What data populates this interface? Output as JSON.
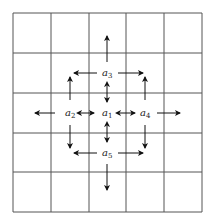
{
  "diagram": {
    "type": "grid-neighborhood",
    "grid": {
      "rows": 5,
      "cols": 5,
      "x0": 13,
      "y0": 13,
      "x1": 202,
      "y1": 212,
      "xlines": [
        13,
        51,
        89,
        126,
        164,
        202
      ],
      "ylines": [
        13,
        53,
        93,
        133,
        172,
        212
      ],
      "line_color": "#555555"
    },
    "labels": [
      {
        "id": "a1",
        "base": "a",
        "sub": "1",
        "x": 102,
        "y": 116
      },
      {
        "id": "a2",
        "base": "a",
        "sub": "2",
        "x": 65,
        "y": 116
      },
      {
        "id": "a3",
        "base": "a",
        "sub": "3",
        "x": 102,
        "y": 76
      },
      {
        "id": "a4",
        "base": "a",
        "sub": "4",
        "x": 140,
        "y": 116
      },
      {
        "id": "a5",
        "base": "a",
        "sub": "5",
        "x": 102,
        "y": 156
      }
    ],
    "arrows": [
      {
        "from": [
          107,
          62
        ],
        "to": [
          107,
          36
        ],
        "double": false
      },
      {
        "from": [
          97,
          73
        ],
        "to": [
          74,
          73
        ],
        "double": false
      },
      {
        "from": [
          118,
          73
        ],
        "to": [
          143,
          73
        ],
        "double": false
      },
      {
        "from": [
          70,
          100
        ],
        "to": [
          70,
          77
        ],
        "double": false
      },
      {
        "from": [
          145,
          100
        ],
        "to": [
          145,
          77
        ],
        "double": false
      },
      {
        "from": [
          107,
          86
        ],
        "to": [
          107,
          102
        ],
        "double": true
      },
      {
        "from": [
          55,
          113
        ],
        "to": [
          35,
          113
        ],
        "double": false
      },
      {
        "from": [
          81,
          113
        ],
        "to": [
          94,
          113
        ],
        "double": true
      },
      {
        "from": [
          120,
          113
        ],
        "to": [
          135,
          113
        ],
        "double": true
      },
      {
        "from": [
          157,
          113
        ],
        "to": [
          180,
          113
        ],
        "double": false
      },
      {
        "from": [
          107,
          126
        ],
        "to": [
          107,
          142
        ],
        "double": true
      },
      {
        "from": [
          70,
          125
        ],
        "to": [
          70,
          148
        ],
        "double": false
      },
      {
        "from": [
          145,
          125
        ],
        "to": [
          145,
          148
        ],
        "double": false
      },
      {
        "from": [
          97,
          153
        ],
        "to": [
          74,
          153
        ],
        "double": false
      },
      {
        "from": [
          118,
          153
        ],
        "to": [
          143,
          153
        ],
        "double": false
      },
      {
        "from": [
          107,
          164
        ],
        "to": [
          107,
          190
        ],
        "double": false
      }
    ]
  }
}
